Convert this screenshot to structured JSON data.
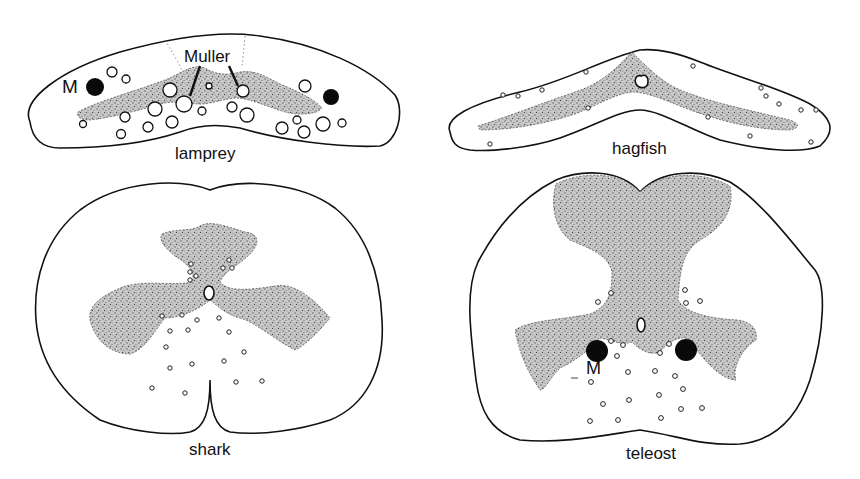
{
  "figure": {
    "panels": [
      {
        "id": "lamprey",
        "caption": "lamprey",
        "labels": {
          "mauthner": "M",
          "muller": "Muller"
        }
      },
      {
        "id": "hagfish",
        "caption": "hagfish"
      },
      {
        "id": "shark",
        "caption": "shark"
      },
      {
        "id": "teleost",
        "caption": "teleost",
        "labels": {
          "mauthner": "M"
        }
      }
    ],
    "colors": {
      "outline": "#111111",
      "grey_matter": "#b8b8b8",
      "background": "#ffffff",
      "mauthner_axon": "#0a0a0a"
    }
  }
}
